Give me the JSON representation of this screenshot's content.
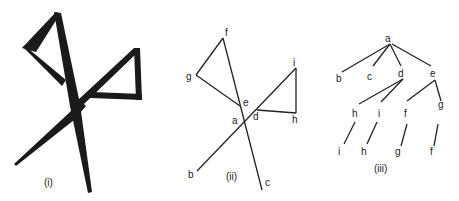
{
  "figure": {
    "panels": [
      {
        "caption": "(i)",
        "description": "Bold hand-drawn pictogram of a figure with two triangular loops crossing at a center point"
      },
      {
        "caption": "(ii)",
        "labels": {
          "a": "a",
          "b": "b",
          "c": "c",
          "d": "d",
          "e": "e",
          "f": "f",
          "g": "g",
          "h": "h",
          "i": "i"
        }
      },
      {
        "caption": "(iii)",
        "tree": {
          "root": "a",
          "level1": [
            "b",
            "c",
            "d",
            "e"
          ],
          "level2": [
            "h",
            "i",
            "f",
            "g"
          ],
          "level3": [
            "i",
            "h",
            "g",
            "f"
          ]
        }
      }
    ]
  }
}
